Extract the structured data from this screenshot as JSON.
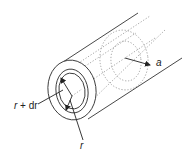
{
  "diagram": {
    "labels": {
      "radius_a": "a",
      "shell_outer": "r + dr",
      "shell_outer_var": "r",
      "shell_outer_rest": " + dr",
      "shell_inner": "r"
    },
    "colors": {
      "line": "#333333",
      "dotted": "#9a9a9a",
      "background": "#ffffff"
    }
  }
}
